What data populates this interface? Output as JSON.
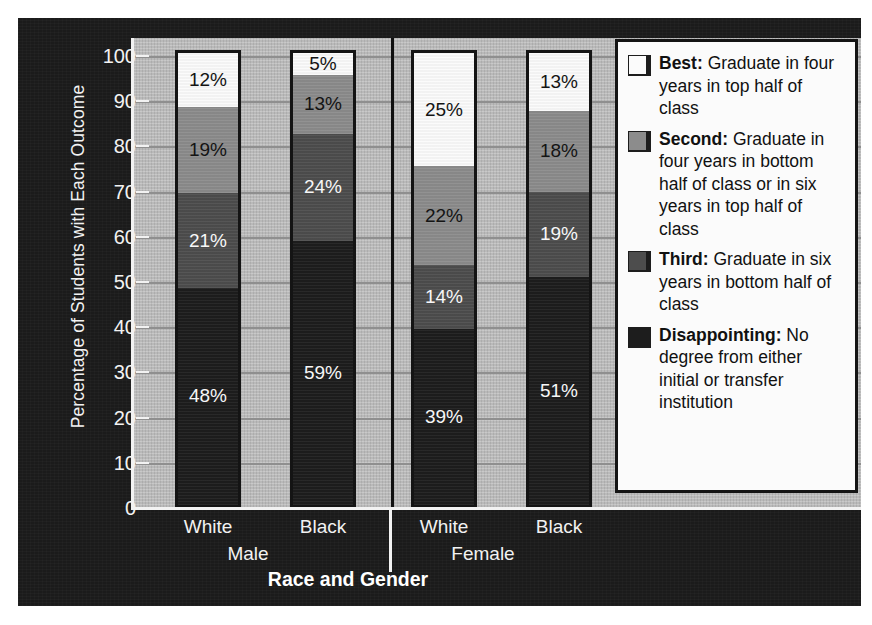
{
  "chart_data": {
    "type": "bar",
    "subtype": "stacked-100-percent",
    "title": "",
    "xlabel": "Race and Gender",
    "ylabel": "Percentage of Students with Each Outcome",
    "ylim": [
      0,
      100
    ],
    "yticks": [
      0,
      10,
      20,
      30,
      40,
      50,
      60,
      70,
      80,
      90,
      100
    ],
    "grid": true,
    "legend_position": "right-inside",
    "groups": [
      "Male",
      "Female"
    ],
    "categories": [
      "White",
      "Black",
      "White",
      "Black"
    ],
    "category_groups": [
      "Male",
      "Male",
      "Female",
      "Female"
    ],
    "series": [
      {
        "name": "Best",
        "description": "Graduate in four years in top half of class",
        "color": "#fbfbfb",
        "values": [
          12,
          5,
          25,
          13
        ],
        "labels": [
          "12%",
          "5%",
          "25%",
          "13%"
        ]
      },
      {
        "name": "Second",
        "description": "Graduate in four years in bottom half of class or in six years in top half of class",
        "color": "#8c8c8c",
        "values": [
          19,
          13,
          22,
          18
        ],
        "labels": [
          "19%",
          "13%",
          "22%",
          "18%"
        ]
      },
      {
        "name": "Third",
        "description": "Graduate in six years in bottom half of class",
        "color": "#4d4d4d",
        "values": [
          21,
          24,
          14,
          19
        ],
        "labels": [
          "21%",
          "24%",
          "14%",
          "19%"
        ]
      },
      {
        "name": "Disappointing",
        "description": "No degree from either initial or transfer institution",
        "color": "#1d1d1d",
        "values": [
          48,
          59,
          39,
          51
        ],
        "labels": [
          "48%",
          "59%",
          "39%",
          "51%"
        ]
      }
    ]
  },
  "axes": {
    "ylabel": "Percentage of Students with Each Outcome",
    "xlabel": "Race and Gender",
    "ytick_labels": [
      "100",
      "90",
      "80",
      "70",
      "60",
      "50",
      "40",
      "30",
      "20",
      "10",
      "0"
    ],
    "xtick_labels": [
      "White",
      "Black",
      "White",
      "Black"
    ],
    "group_labels": [
      "Male",
      "Female"
    ]
  },
  "legend": {
    "items": [
      {
        "swatch": "legend-swatch-best",
        "term": "Best:",
        "text": " Graduate in four years in top half of class"
      },
      {
        "swatch": "legend-swatch-second",
        "term": "Second:",
        "text": " Graduate in four years in bottom half of class or in six years in top half of class"
      },
      {
        "swatch": "legend-swatch-third",
        "term": "Third:",
        "text": " Graduate in six years in bottom half of class"
      },
      {
        "swatch": "legend-swatch-disappointing",
        "term": "Disappointing:",
        "text": " No degree from either initial or transfer institution"
      }
    ]
  },
  "colors": {
    "panel_background": "#1b1b1b",
    "plot_background": "#bdbdbd",
    "gridline": "#8f8f8f",
    "axis": "#f2f2f2",
    "best": "#fbfbfb",
    "second": "#8c8c8c",
    "third": "#4d4d4d",
    "disappointing": "#1d1d1d"
  }
}
